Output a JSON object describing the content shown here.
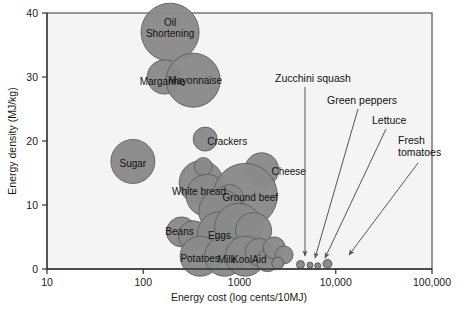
{
  "figure": {
    "background_color": "#ffffff",
    "plot_background_color": "#f4f4f4",
    "bubble_color": "#8a8a8a",
    "axis_color": "#333333"
  },
  "chart_data": {
    "type": "scatter",
    "title": "",
    "xlabel": "Energy cost (log cents/10MJ)",
    "ylabel": "Energy density (MJ/kg)",
    "xscale": "log",
    "yscale": "linear",
    "xlim": [
      10,
      100000
    ],
    "ylim": [
      0,
      40
    ],
    "xticks": [
      "10",
      "100",
      "1000",
      "10,000",
      "100,000"
    ],
    "xtick_values": [
      10,
      100,
      1000,
      10000,
      100000
    ],
    "yticks": [
      "0",
      "10",
      "20",
      "30",
      "40"
    ],
    "ytick_values": [
      0,
      10,
      20,
      30,
      40
    ],
    "grid": false,
    "legend": "none",
    "size_encoding": "bubble area represents relative amount consumed",
    "points": [
      {
        "name": "Oil Shortening",
        "label": "Oil\nShortening",
        "x": 190,
        "y": 37.0,
        "r": 29,
        "label_show": true,
        "label_dx": 0,
        "label_dy": -4
      },
      {
        "name": "Margarine",
        "label": "Margarine",
        "x": 165,
        "y": 30.0,
        "r": 17,
        "label_show": true,
        "label_dx": -2,
        "label_dy": 4
      },
      {
        "name": "Mayonnaise",
        "label": "Mayonnaise",
        "x": 330,
        "y": 29.5,
        "r": 27,
        "label_show": true,
        "label_dx": 2,
        "label_dy": 0
      },
      {
        "name": "Crackers",
        "label": "Crackers",
        "x": 440,
        "y": 20.3,
        "r": 12,
        "label_show": true,
        "label_dx": 22,
        "label_dy": 2
      },
      {
        "name": "Sugar",
        "label": "Sugar",
        "x": 78,
        "y": 16.8,
        "r": 22,
        "label_show": true,
        "label_dx": 0,
        "label_dy": 2
      },
      {
        "name": "Cheese",
        "label": "Cheese",
        "x": 1700,
        "y": 15.5,
        "r": 17,
        "label_show": true,
        "label_dx": 27,
        "label_dy": 2
      },
      {
        "name": "White bread cluster A",
        "label": "",
        "x": 400,
        "y": 13.5,
        "r": 22,
        "label_show": false,
        "label_dx": 0,
        "label_dy": 0
      },
      {
        "name": "White bread inner",
        "label": "",
        "x": 420,
        "y": 16.0,
        "r": 9,
        "label_show": false,
        "label_dx": 0,
        "label_dy": 0
      },
      {
        "name": "White bread",
        "label": "White bread",
        "x": 460,
        "y": 11.5,
        "r": 21,
        "label_show": true,
        "label_dx": -8,
        "label_dy": -4
      },
      {
        "name": "Ground beef",
        "label": "Ground beef",
        "x": 1150,
        "y": 11.5,
        "r": 32,
        "label_show": true,
        "label_dx": 5,
        "label_dy": 2
      },
      {
        "name": "Ground beef inner",
        "label": "",
        "x": 790,
        "y": 11.0,
        "r": 14,
        "label_show": false,
        "label_dx": 0,
        "label_dy": 0
      },
      {
        "name": "Cluster mid B",
        "label": "",
        "x": 640,
        "y": 9.0,
        "r": 22,
        "label_show": false,
        "label_dx": 0,
        "label_dy": 0
      },
      {
        "name": "Beans",
        "label": "Beans",
        "x": 250,
        "y": 5.8,
        "r": 15,
        "label_show": true,
        "label_dx": -2,
        "label_dy": 0
      },
      {
        "name": "Beans neighbor",
        "label": "",
        "x": 330,
        "y": 5.2,
        "r": 15,
        "label_show": false,
        "label_dx": 0,
        "label_dy": 0
      },
      {
        "name": "Eggs",
        "label": "Eggs",
        "x": 620,
        "y": 5.5,
        "r": 22,
        "label_show": true,
        "label_dx": 0,
        "label_dy": 2
      },
      {
        "name": "Cluster mid C",
        "label": "",
        "x": 980,
        "y": 6.5,
        "r": 24,
        "label_show": false,
        "label_dx": 0,
        "label_dy": 0
      },
      {
        "name": "Cluster mid D",
        "label": "",
        "x": 1400,
        "y": 6.0,
        "r": 18,
        "label_show": false,
        "label_dx": 0,
        "label_dy": 0
      },
      {
        "name": "Potatoes",
        "label": "Potatoes",
        "x": 390,
        "y": 2.0,
        "r": 20,
        "label_show": true,
        "label_dx": 0,
        "label_dy": 2
      },
      {
        "name": "Milk",
        "label": "Milk",
        "x": 700,
        "y": 2.0,
        "r": 20,
        "label_show": true,
        "label_dx": 2,
        "label_dy": 3
      },
      {
        "name": "KoolAid",
        "label": "KoolAid",
        "x": 1150,
        "y": 2.0,
        "r": 20,
        "label_show": true,
        "label_dx": 4,
        "label_dy": 3
      },
      {
        "name": "Cluster low E",
        "label": "",
        "x": 1600,
        "y": 2.6,
        "r": 14,
        "label_show": false,
        "label_dx": 0,
        "label_dy": 0
      },
      {
        "name": "Cluster low F",
        "label": "",
        "x": 1950,
        "y": 1.3,
        "r": 11,
        "label_show": false,
        "label_dx": 0,
        "label_dy": 0
      },
      {
        "name": "Cluster low G",
        "label": "",
        "x": 2300,
        "y": 3.3,
        "r": 11,
        "label_show": false,
        "label_dx": 0,
        "label_dy": 0
      },
      {
        "name": "Cluster low H",
        "label": "",
        "x": 2900,
        "y": 2.2,
        "r": 9,
        "label_show": false,
        "label_dx": 0,
        "label_dy": 0
      },
      {
        "name": "Cluster low I",
        "label": "",
        "x": 2500,
        "y": 0.9,
        "r": 6,
        "label_show": false,
        "label_dx": 0,
        "label_dy": 0
      },
      {
        "name": "Zucchini squash",
        "label": "",
        "x": 4300,
        "y": 0.7,
        "r": 4,
        "label_show": false,
        "label_dx": 0,
        "label_dy": 0
      },
      {
        "name": "Green peppers",
        "label": "",
        "x": 5400,
        "y": 0.6,
        "r": 3,
        "label_show": false,
        "label_dx": 0,
        "label_dy": 0
      },
      {
        "name": "Lettuce",
        "label": "",
        "x": 8200,
        "y": 0.8,
        "r": 4.5,
        "label_show": false,
        "label_dx": 0,
        "label_dy": 0
      },
      {
        "name": "Fresh tomatoes",
        "label": "",
        "x": 6500,
        "y": 0.5,
        "r": 3,
        "label_show": false,
        "label_dx": 0,
        "label_dy": 0
      }
    ],
    "annotations": [
      {
        "name": "zucchini-squash",
        "text": "Zucchini squash",
        "text_x": 275,
        "text_y": 82,
        "line_x1": 305,
        "line_y1": 87,
        "line_x2": 305,
        "line_y2": 256,
        "arrow": true
      },
      {
        "name": "green-peppers",
        "text": "Green peppers",
        "text_x": 327,
        "text_y": 104,
        "line_x1": 358,
        "line_y1": 109,
        "line_x2": 315,
        "line_y2": 258,
        "arrow": true
      },
      {
        "name": "lettuce",
        "text": "Lettuce",
        "text_x": 372,
        "text_y": 124,
        "line_x1": 386,
        "line_y1": 129,
        "line_x2": 325,
        "line_y2": 258,
        "arrow": true
      },
      {
        "name": "fresh-tomatoes",
        "text": "Fresh\ntomatoes",
        "text_x": 398,
        "text_y": 144,
        "line_x1": 418,
        "line_y1": 163,
        "line_x2": 349,
        "line_y2": 255,
        "arrow": true
      }
    ]
  }
}
